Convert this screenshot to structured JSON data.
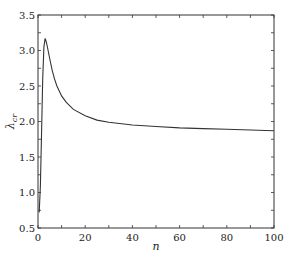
{
  "chart_data": {
    "type": "line",
    "title": "",
    "xlabel": "n",
    "ylabel": "λ_cr",
    "xlim": [
      0,
      100
    ],
    "ylim": [
      0.5,
      3.5
    ],
    "xticks": [
      0,
      20,
      40,
      60,
      80,
      100
    ],
    "xtick_labels": [
      "0",
      "20",
      "40",
      "60",
      "80",
      "100"
    ],
    "yticks": [
      0.5,
      1.0,
      1.5,
      2.0,
      2.5,
      3.0,
      3.5
    ],
    "ytick_labels": [
      "0.5",
      "1.0",
      "1.5",
      "2.0",
      "2.5",
      "3.0",
      "3.5"
    ],
    "grid": false,
    "legend": null,
    "series": [
      {
        "name": "λ_cr(n)",
        "color": "#333333",
        "x": [
          0.5,
          1,
          1.5,
          2,
          2.5,
          3,
          3.5,
          4,
          5,
          6,
          7,
          8,
          10,
          12,
          15,
          20,
          25,
          30,
          40,
          50,
          60,
          70,
          80,
          90,
          100
        ],
        "y": [
          0.72,
          1.1,
          1.8,
          2.6,
          3.05,
          3.17,
          3.12,
          3.05,
          2.88,
          2.72,
          2.6,
          2.5,
          2.36,
          2.27,
          2.17,
          2.08,
          2.02,
          1.99,
          1.95,
          1.93,
          1.91,
          1.9,
          1.89,
          1.88,
          1.87
        ]
      }
    ]
  }
}
